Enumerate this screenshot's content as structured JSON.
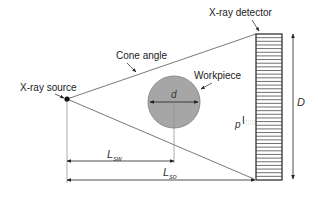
{
  "diagram": {
    "labels": {
      "detector": "X-ray detector",
      "cone_angle": "Cone angle",
      "source": "X-ray source",
      "workpiece": "Workpiece",
      "d": "d",
      "D": "D",
      "p": "p",
      "L_sw": "L",
      "L_sw_sub": "sw",
      "L_so": "L",
      "L_so_sub": "so"
    },
    "colors": {
      "line": "#222222",
      "ray": "#555555",
      "workpiece_fill": "#a6a6a6",
      "workpiece_stroke": "#8c8c8c"
    },
    "detector_stripe_count": 40
  }
}
